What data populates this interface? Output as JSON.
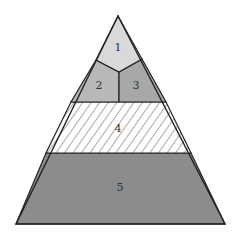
{
  "diagram": {
    "type": "pyramid",
    "sections": [
      {
        "id": "1",
        "label": "1",
        "fill": "#d9d9d9",
        "pattern": "solid"
      },
      {
        "id": "2",
        "label": "2",
        "fill": "#b8b8b8",
        "pattern": "solid"
      },
      {
        "id": "3",
        "label": "3",
        "fill": "#a8a8a8",
        "pattern": "solid"
      },
      {
        "id": "4",
        "label": "4",
        "fill": "#ffffff",
        "pattern": "diagonal-hatch"
      },
      {
        "id": "5",
        "label": "5",
        "fill": "#8c8c8c",
        "pattern": "solid"
      }
    ],
    "stroke_color": "#222222"
  }
}
